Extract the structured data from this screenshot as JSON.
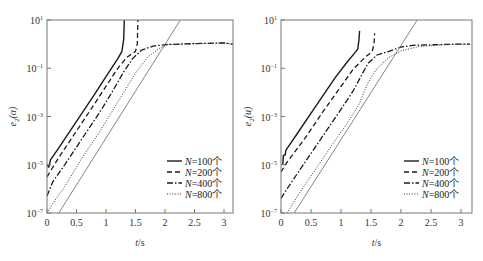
{
  "chart_data": [
    {
      "type": "line",
      "panel": "left",
      "title": "",
      "xlabel": "t/s",
      "ylabel": "e2(α)",
      "ylabel_main": "e",
      "ylabel_sub": "2",
      "ylabel_arg": "(α)",
      "xlim": [
        0,
        3.15
      ],
      "ylim_log10": [
        -7,
        1
      ],
      "yscale": "log",
      "grid": false,
      "legend_position": "lower right",
      "x_ticks": [
        0,
        0.5,
        1,
        1.5,
        2,
        2.5,
        3
      ],
      "x_tick_labels": [
        "0",
        "0.5",
        "1",
        "1.5",
        "2",
        "2.5",
        "3"
      ],
      "y_ticks_log10": [
        1,
        -1,
        -3,
        -5,
        -7
      ],
      "y_tick_labels": [
        {
          "base": "10",
          "exp": "1"
        },
        {
          "base": "10",
          "exp": "-1"
        },
        {
          "base": "10",
          "exp": "-3"
        },
        {
          "base": "10",
          "exp": "-5"
        },
        {
          "base": "10",
          "exp": "-7"
        }
      ],
      "series": [
        {
          "name": "N=100个",
          "style": "solid",
          "points_t_log10": [
            [
              0.0,
              -5.0
            ],
            [
              0.03,
              -5.1
            ],
            [
              0.06,
              -4.8
            ],
            [
              0.2,
              -4.3
            ],
            [
              0.5,
              -3.2
            ],
            [
              0.8,
              -2.1
            ],
            [
              1.0,
              -1.35
            ],
            [
              1.2,
              -0.6
            ],
            [
              1.27,
              -0.3
            ],
            [
              1.3,
              0.2
            ],
            [
              1.31,
              1.0
            ]
          ]
        },
        {
          "name": "N=200个",
          "style": "dashed",
          "points_t_log10": [
            [
              0.0,
              -5.5
            ],
            [
              0.2,
              -4.7
            ],
            [
              0.5,
              -3.6
            ],
            [
              0.8,
              -2.5
            ],
            [
              1.0,
              -1.75
            ],
            [
              1.2,
              -1.0
            ],
            [
              1.35,
              -0.55
            ],
            [
              1.5,
              -0.3
            ],
            [
              1.53,
              0.0
            ],
            [
              1.54,
              1.0
            ]
          ]
        },
        {
          "name": "N=400个",
          "style": "dashdot",
          "points_t_log10": [
            [
              0.0,
              -6.3
            ],
            [
              0.1,
              -5.7
            ],
            [
              0.3,
              -5.0
            ],
            [
              0.6,
              -3.9
            ],
            [
              0.9,
              -2.8
            ],
            [
              1.1,
              -2.0
            ],
            [
              1.3,
              -1.15
            ],
            [
              1.45,
              -0.6
            ],
            [
              1.6,
              -0.25
            ],
            [
              1.8,
              -0.08
            ],
            [
              2.0,
              -0.02
            ],
            [
              2.5,
              0.02
            ],
            [
              3.0,
              0.05
            ],
            [
              3.15,
              0.0
            ]
          ]
        },
        {
          "name": "N=800个",
          "style": "dotted",
          "points_t_log10": [
            [
              0.0,
              -7.0
            ],
            [
              0.1,
              -6.6
            ],
            [
              0.3,
              -5.9
            ],
            [
              0.6,
              -4.7
            ],
            [
              0.9,
              -3.6
            ],
            [
              1.1,
              -2.8
            ],
            [
              1.3,
              -2.0
            ],
            [
              1.5,
              -1.2
            ],
            [
              1.7,
              -0.55
            ],
            [
              1.9,
              -0.18
            ],
            [
              2.05,
              -0.02
            ],
            [
              2.5,
              0.02
            ],
            [
              3.0,
              0.05
            ],
            [
              3.15,
              0.0
            ]
          ]
        },
        {
          "name": "reference",
          "style": "thin-solid",
          "points_t_log10": [
            [
              0.2,
              -7.0
            ],
            [
              2.26,
              1.0
            ]
          ]
        }
      ],
      "legend": [
        "N=100个",
        "N=200个",
        "N=400个",
        "N=800个"
      ]
    },
    {
      "type": "line",
      "panel": "right",
      "title": "",
      "xlabel": "t/s",
      "ylabel": "e2(u)",
      "ylabel_main": "e",
      "ylabel_sub": "2",
      "ylabel_arg": "(u)",
      "xlim": [
        0,
        3.15
      ],
      "ylim_log10": [
        -7,
        1
      ],
      "yscale": "log",
      "grid": false,
      "legend_position": "lower right",
      "x_ticks": [
        0,
        0.5,
        1,
        1.5,
        2,
        2.5,
        3
      ],
      "x_tick_labels": [
        "0",
        "0.5",
        "1",
        "1.5",
        "2",
        "2.5",
        "3"
      ],
      "y_ticks_log10": [
        1,
        -1,
        -3,
        -5,
        -7
      ],
      "y_tick_labels": [
        {
          "base": "10",
          "exp": "1"
        },
        {
          "base": "10",
          "exp": "-1"
        },
        {
          "base": "10",
          "exp": "-3"
        },
        {
          "base": "10",
          "exp": "-5"
        },
        {
          "base": "10",
          "exp": "-7"
        }
      ],
      "series": [
        {
          "name": "N=100个",
          "style": "solid",
          "points_t_log10": [
            [
              0.03,
              -5.0
            ],
            [
              0.04,
              -4.6
            ],
            [
              0.07,
              -4.6
            ],
            [
              0.08,
              -4.4
            ],
            [
              0.3,
              -3.6
            ],
            [
              0.6,
              -2.5
            ],
            [
              0.9,
              -1.4
            ],
            [
              1.1,
              -0.75
            ],
            [
              1.25,
              -0.3
            ],
            [
              1.28,
              -0.2
            ],
            [
              1.3,
              0.2
            ],
            [
              1.31,
              0.55
            ]
          ]
        },
        {
          "name": "N=200个",
          "style": "dashed",
          "points_t_log10": [
            [
              0.0,
              -5.3
            ],
            [
              0.1,
              -4.9
            ],
            [
              0.4,
              -3.9
            ],
            [
              0.7,
              -2.8
            ],
            [
              1.0,
              -1.75
            ],
            [
              1.2,
              -1.05
            ],
            [
              1.4,
              -0.55
            ],
            [
              1.52,
              -0.3
            ],
            [
              1.55,
              0.0
            ],
            [
              1.56,
              0.45
            ]
          ]
        },
        {
          "name": "N=400个",
          "style": "dashdot",
          "points_t_log10": [
            [
              0.0,
              -6.4
            ],
            [
              0.1,
              -6.0
            ],
            [
              0.4,
              -4.9
            ],
            [
              0.7,
              -3.8
            ],
            [
              1.0,
              -2.7
            ],
            [
              1.2,
              -1.95
            ],
            [
              1.35,
              -1.25
            ],
            [
              1.45,
              -0.8
            ],
            [
              1.6,
              -0.45
            ],
            [
              1.8,
              -0.3
            ],
            [
              2.0,
              -0.12
            ],
            [
              2.2,
              -0.05
            ],
            [
              2.6,
              -0.02
            ],
            [
              3.0,
              0.0
            ],
            [
              3.15,
              0.0
            ]
          ]
        },
        {
          "name": "N=800个",
          "style": "dotted",
          "points_t_log10": [
            [
              0.1,
              -7.0
            ],
            [
              0.3,
              -6.2
            ],
            [
              0.6,
              -5.1
            ],
            [
              0.9,
              -4.0
            ],
            [
              1.1,
              -3.3
            ],
            [
              1.3,
              -2.5
            ],
            [
              1.45,
              -1.6
            ],
            [
              1.6,
              -1.0
            ],
            [
              1.8,
              -0.55
            ],
            [
              2.0,
              -0.28
            ],
            [
              2.3,
              -0.1
            ],
            [
              2.7,
              -0.03
            ],
            [
              3.0,
              0.0
            ],
            [
              3.15,
              0.0
            ]
          ]
        },
        {
          "name": "reference",
          "style": "thin-solid",
          "points_t_log10": [
            [
              0.22,
              -7.0
            ],
            [
              2.27,
              1.0
            ]
          ]
        }
      ],
      "legend": [
        "N=100个",
        "N=200个",
        "N=400个",
        "N=800个"
      ]
    }
  ]
}
